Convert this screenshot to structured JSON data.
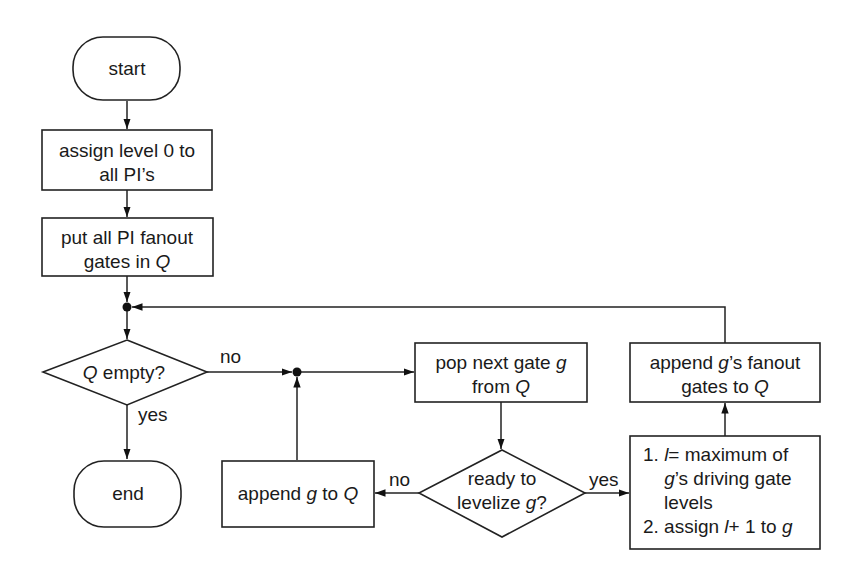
{
  "diagram": {
    "type": "flowchart",
    "nodes": {
      "start": {
        "kind": "terminal",
        "text": "start"
      },
      "assign_level": {
        "kind": "process",
        "lines": [
          [
            {
              "t": "assign level 0 to"
            }
          ],
          [
            {
              "t": "all PI’s"
            }
          ]
        ]
      },
      "put_fanout": {
        "kind": "process",
        "lines": [
          [
            {
              "t": "put all PI fanout"
            }
          ],
          [
            {
              "t": "gates in "
            },
            {
              "t": "Q",
              "i": true
            }
          ]
        ]
      },
      "q_empty": {
        "kind": "decision",
        "lines": [
          [
            {
              "t": "Q",
              "i": true
            },
            {
              "t": " empty?"
            }
          ]
        ]
      },
      "end": {
        "kind": "terminal",
        "text": "end"
      },
      "pop_gate": {
        "kind": "process",
        "lines": [
          [
            {
              "t": "pop next gate "
            },
            {
              "t": "g",
              "i": true
            }
          ],
          [
            {
              "t": "from "
            },
            {
              "t": "Q",
              "i": true
            }
          ]
        ]
      },
      "ready": {
        "kind": "decision",
        "lines": [
          [
            {
              "t": "ready to"
            }
          ],
          [
            {
              "t": "levelize "
            },
            {
              "t": "g",
              "i": true
            },
            {
              "t": "?"
            }
          ]
        ]
      },
      "append_g": {
        "kind": "process",
        "lines": [
          [
            {
              "t": "append "
            },
            {
              "t": "g",
              "i": true
            },
            {
              "t": " to "
            },
            {
              "t": "Q",
              "i": true
            }
          ]
        ]
      },
      "levelize": {
        "kind": "process",
        "lines": [
          [
            {
              "t": "1. "
            },
            {
              "t": "l",
              "i": true
            },
            {
              "t": "= maximum of"
            }
          ],
          [
            {
              "t": "    "
            },
            {
              "t": "g",
              "i": true
            },
            {
              "t": "’s driving gate"
            }
          ],
          [
            {
              "t": "    levels"
            }
          ],
          [
            {
              "t": "2. assign "
            },
            {
              "t": "l",
              "i": true
            },
            {
              "t": "+ 1 to "
            },
            {
              "t": "g",
              "i": true
            }
          ]
        ]
      },
      "append_fanout": {
        "kind": "process",
        "lines": [
          [
            {
              "t": "append "
            },
            {
              "t": "g",
              "i": true
            },
            {
              "t": "’s fanout"
            }
          ],
          [
            {
              "t": "gates to "
            },
            {
              "t": "Q",
              "i": true
            }
          ]
        ]
      }
    },
    "edge_labels": {
      "q_empty_no": "no",
      "q_empty_yes": "yes",
      "ready_no": "no",
      "ready_yes": "yes"
    },
    "edges": [
      [
        "start",
        "assign_level"
      ],
      [
        "assign_level",
        "put_fanout"
      ],
      [
        "put_fanout",
        "junction_top"
      ],
      [
        "junction_top",
        "q_empty"
      ],
      [
        "q_empty",
        "end",
        "yes"
      ],
      [
        "q_empty",
        "junction_mid",
        "no"
      ],
      [
        "junction_mid",
        "pop_gate"
      ],
      [
        "pop_gate",
        "ready"
      ],
      [
        "ready",
        "append_g",
        "no"
      ],
      [
        "append_g",
        "junction_mid"
      ],
      [
        "ready",
        "levelize",
        "yes"
      ],
      [
        "levelize",
        "append_fanout"
      ],
      [
        "append_fanout",
        "junction_top"
      ]
    ]
  }
}
